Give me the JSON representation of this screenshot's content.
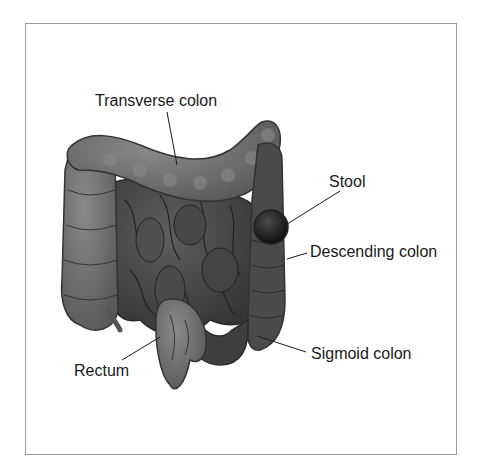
{
  "diagram": {
    "labels": {
      "transverse_colon": "Transverse colon",
      "stool": "Stool",
      "descending_colon": "Descending colon",
      "sigmoid_colon": "Sigmoid colon",
      "rectum": "Rectum"
    },
    "colors": {
      "colon": "#6f6f6f",
      "colon_dark": "#3d3d3d",
      "small_intestine": "#4a4a4a",
      "stool": "#262626",
      "frame": "#9a9a9a",
      "leader_line": "#1a1a1a"
    }
  }
}
